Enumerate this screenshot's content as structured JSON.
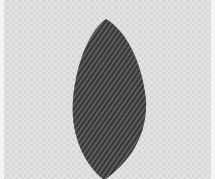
{
  "image": {
    "subject": "embroidered leaf on fabric",
    "colors": {
      "fabric": "#e2e2e2",
      "fabric_weave": "#d2d2d2",
      "thread_dark": "#3a3a3a",
      "thread_mid": "#555555",
      "thread_light": "#7a7a7a"
    }
  }
}
